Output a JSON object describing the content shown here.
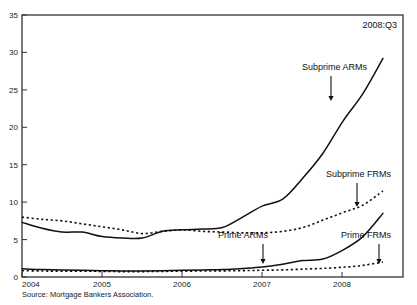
{
  "chart_data": {
    "type": "line",
    "title": "",
    "subtitle": "",
    "xlabel": "",
    "ylabel": "",
    "corner_annotation": "2008:Q3",
    "source": "Source: Mortgage Bankers Association.",
    "xlim": [
      2004.0,
      2008.75
    ],
    "ylim": [
      0,
      35
    ],
    "yticks": [
      0,
      5,
      10,
      15,
      20,
      25,
      30,
      35
    ],
    "xticks": [
      2004,
      2005,
      2006,
      2007,
      2008
    ],
    "xtick_labels": [
      "2004",
      "2005",
      "2006",
      "2007",
      "2008"
    ],
    "ytick_labels": [
      "0",
      "5",
      "10",
      "15",
      "20",
      "25",
      "30",
      "35"
    ],
    "grid": false,
    "legend": "inline-annotations",
    "x": [
      2004.0,
      2004.25,
      2004.5,
      2004.75,
      2005.0,
      2005.25,
      2005.5,
      2005.75,
      2006.0,
      2006.25,
      2006.5,
      2006.75,
      2007.0,
      2007.25,
      2007.5,
      2007.75,
      2008.0,
      2008.25,
      2008.5
    ],
    "series": [
      {
        "name": "Subprime ARMs",
        "style": "solid",
        "values": [
          7.3,
          6.5,
          6.0,
          6.0,
          5.4,
          5.2,
          5.2,
          6.1,
          6.3,
          6.4,
          6.6,
          8.0,
          9.5,
          10.4,
          13.2,
          16.5,
          20.8,
          24.5,
          29.2
        ]
      },
      {
        "name": "Subprime FRMs",
        "style": "dotted",
        "values": [
          8.0,
          7.7,
          7.5,
          7.1,
          6.7,
          6.3,
          5.8,
          6.1,
          6.3,
          6.1,
          6.0,
          5.9,
          5.9,
          6.1,
          6.6,
          7.6,
          8.6,
          9.6,
          11.5
        ]
      },
      {
        "name": "Prime ARMs",
        "style": "solid",
        "values": [
          1.1,
          1.0,
          0.95,
          0.9,
          0.85,
          0.8,
          0.8,
          0.85,
          0.9,
          0.95,
          1.0,
          1.15,
          1.35,
          1.7,
          2.2,
          2.4,
          3.6,
          5.4,
          8.5
        ]
      },
      {
        "name": "Prime FRMs",
        "style": "dotted",
        "values": [
          0.85,
          0.8,
          0.78,
          0.78,
          0.75,
          0.72,
          0.72,
          0.75,
          0.78,
          0.8,
          0.82,
          0.85,
          0.9,
          0.95,
          1.05,
          1.15,
          1.3,
          1.55,
          2.0
        ]
      }
    ],
    "annotations": [
      {
        "label": "Subprime ARMs",
        "text_x": 302,
        "text_y": 70,
        "arrow_x": 331,
        "arrow_y0": 76,
        "arrow_y1": 101
      },
      {
        "label": "Subprime FRMs",
        "text_x": 326,
        "text_y": 177,
        "arrow_x": 357,
        "arrow_y0": 183,
        "arrow_y1": 207
      },
      {
        "label": "Prime ARMs",
        "text_x": 218,
        "text_y": 238,
        "arrow_x": 263,
        "arrow_y0": 244,
        "arrow_y1": 264
      },
      {
        "label": "Prime FRMs",
        "text_x": 341,
        "text_y": 238,
        "arrow_x": 379,
        "arrow_y0": 244,
        "arrow_y1": 264
      }
    ]
  }
}
